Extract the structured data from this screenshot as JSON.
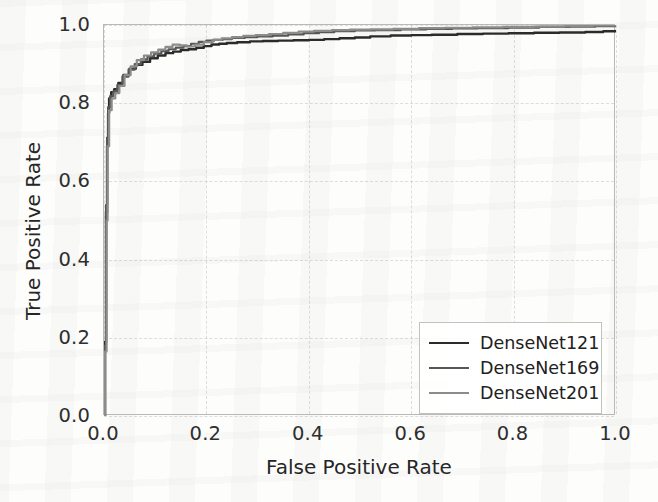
{
  "chart_data": {
    "type": "line",
    "title": "",
    "xlabel": "False Positive Rate",
    "ylabel": "True Positive Rate",
    "xlim": [
      0.0,
      1.0
    ],
    "ylim": [
      0.0,
      1.0
    ],
    "xticks": [
      "0.0",
      "0.2",
      "0.4",
      "0.6",
      "0.8",
      "1.0"
    ],
    "xtick_values": [
      0.0,
      0.2,
      0.4,
      0.6,
      0.8,
      1.0
    ],
    "yticks": [
      "0.0",
      "0.2",
      "0.4",
      "0.6",
      "0.8",
      "1.0"
    ],
    "ytick_values": [
      0.0,
      0.2,
      0.4,
      0.6,
      0.8,
      1.0
    ],
    "grid": true,
    "legend_position": "lower right",
    "series": [
      {
        "name": "DenseNet121",
        "color": "#2b2b2b",
        "linewidth": 2.4,
        "x": [
          0.0,
          0.002,
          0.004,
          0.006,
          0.008,
          0.01,
          0.014,
          0.02,
          0.028,
          0.038,
          0.05,
          0.062,
          0.075,
          0.09,
          0.105,
          0.12,
          0.135,
          0.15,
          0.165,
          0.18,
          0.195,
          0.21,
          0.225,
          0.24,
          0.26,
          0.285,
          0.31,
          0.34,
          0.37,
          0.4,
          0.43,
          0.46,
          0.49,
          0.52,
          0.56,
          0.6,
          0.64,
          0.69,
          0.74,
          0.79,
          0.84,
          0.89,
          0.94,
          0.975,
          1.0
        ],
        "y": [
          0.0,
          0.19,
          0.52,
          0.69,
          0.775,
          0.812,
          0.828,
          0.836,
          0.852,
          0.872,
          0.888,
          0.898,
          0.906,
          0.915,
          0.922,
          0.928,
          0.932,
          0.936,
          0.938,
          0.942,
          0.946,
          0.95,
          0.952,
          0.954,
          0.956,
          0.958,
          0.959,
          0.96,
          0.961,
          0.962,
          0.964,
          0.966,
          0.968,
          0.971,
          0.973,
          0.974,
          0.975,
          0.977,
          0.978,
          0.979,
          0.98,
          0.981,
          0.982,
          0.984,
          0.985
        ]
      },
      {
        "name": "DenseNet169",
        "color": "#575757",
        "linewidth": 2.2,
        "x": [
          0.0,
          0.002,
          0.004,
          0.006,
          0.008,
          0.012,
          0.018,
          0.026,
          0.036,
          0.048,
          0.06,
          0.072,
          0.085,
          0.098,
          0.112,
          0.126,
          0.14,
          0.155,
          0.17,
          0.185,
          0.2,
          0.215,
          0.232,
          0.25,
          0.275,
          0.3,
          0.33,
          0.36,
          0.39,
          0.42,
          0.45,
          0.49,
          0.53,
          0.58,
          0.63,
          0.68,
          0.73,
          0.79,
          0.85,
          0.91,
          0.96,
          1.0
        ],
        "y": [
          0.0,
          0.18,
          0.54,
          0.712,
          0.79,
          0.818,
          0.83,
          0.846,
          0.868,
          0.886,
          0.9,
          0.912,
          0.92,
          0.927,
          0.933,
          0.938,
          0.942,
          0.946,
          0.952,
          0.957,
          0.96,
          0.962,
          0.964,
          0.967,
          0.969,
          0.971,
          0.973,
          0.976,
          0.979,
          0.982,
          0.984,
          0.986,
          0.987,
          0.989,
          0.99,
          0.991,
          0.992,
          0.993,
          0.995,
          0.996,
          0.997,
          0.998
        ]
      },
      {
        "name": "DenseNet201",
        "color": "#8c8c8c",
        "linewidth": 2.2,
        "x": [
          0.0,
          0.002,
          0.005,
          0.007,
          0.01,
          0.015,
          0.022,
          0.03,
          0.04,
          0.052,
          0.064,
          0.078,
          0.092,
          0.106,
          0.12,
          0.134,
          0.148,
          0.162,
          0.178,
          0.195,
          0.212,
          0.23,
          0.25,
          0.272,
          0.296,
          0.322,
          0.35,
          0.38,
          0.41,
          0.445,
          0.48,
          0.52,
          0.565,
          0.615,
          0.665,
          0.72,
          0.78,
          0.84,
          0.9,
          0.955,
          1.0
        ],
        "y": [
          0.0,
          0.165,
          0.5,
          0.69,
          0.782,
          0.812,
          0.826,
          0.844,
          0.872,
          0.894,
          0.91,
          0.922,
          0.93,
          0.937,
          0.944,
          0.95,
          0.948,
          0.945,
          0.95,
          0.956,
          0.962,
          0.966,
          0.969,
          0.972,
          0.974,
          0.977,
          0.98,
          0.983,
          0.985,
          0.987,
          0.988,
          0.989,
          0.99,
          0.992,
          0.993,
          0.994,
          0.995,
          0.996,
          0.997,
          0.999,
          1.0
        ]
      }
    ]
  },
  "legend": {
    "entries": [
      {
        "label": "DenseNet121",
        "color": "#2b2b2b",
        "width": 2.6
      },
      {
        "label": "DenseNet169",
        "color": "#575757",
        "width": 2.3
      },
      {
        "label": "DenseNet201",
        "color": "#8c8c8c",
        "width": 2.1
      }
    ]
  }
}
